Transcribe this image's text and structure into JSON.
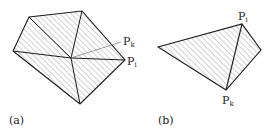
{
  "figure_a": {
    "caption": "(a)",
    "labels": {
      "pk": "P",
      "pk_sub": "k",
      "pi": "P",
      "pi_sub": "i"
    }
  },
  "figure_b": {
    "caption": "(b)",
    "labels": {
      "pi": "P",
      "pi_sub": "i",
      "pk": "P",
      "pk_sub": "k"
    }
  },
  "colors": {
    "stroke": "#1a1a1a",
    "hatch": "#9a9a9a",
    "leader": "#777777"
  }
}
